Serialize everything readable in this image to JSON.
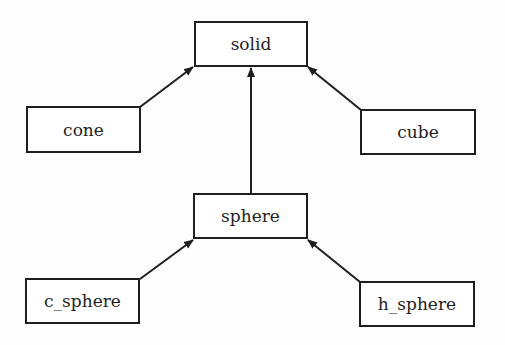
{
  "diagram": {
    "type": "class-hierarchy",
    "nodes": [
      {
        "id": "solid",
        "label": "solid",
        "x": 194,
        "y": 21,
        "w": 114,
        "h": 46
      },
      {
        "id": "cone",
        "label": "cone",
        "x": 26,
        "y": 106,
        "w": 115,
        "h": 47
      },
      {
        "id": "cube",
        "label": "cube",
        "x": 360,
        "y": 109,
        "w": 116,
        "h": 46
      },
      {
        "id": "sphere",
        "label": "sphere",
        "x": 193,
        "y": 193,
        "w": 115,
        "h": 46
      },
      {
        "id": "c_sphere",
        "label": "c_sphere",
        "x": 25,
        "y": 278,
        "w": 115,
        "h": 46
      },
      {
        "id": "h_sphere",
        "label": "h_sphere",
        "x": 359,
        "y": 281,
        "w": 116,
        "h": 46
      }
    ],
    "edges": [
      {
        "from": "cone",
        "to": "solid"
      },
      {
        "from": "cube",
        "to": "solid"
      },
      {
        "from": "sphere",
        "to": "solid"
      },
      {
        "from": "c_sphere",
        "to": "sphere"
      },
      {
        "from": "h_sphere",
        "to": "sphere"
      }
    ],
    "colors": {
      "stroke": "#1e1e1e",
      "background": "#fdfdfd"
    }
  }
}
